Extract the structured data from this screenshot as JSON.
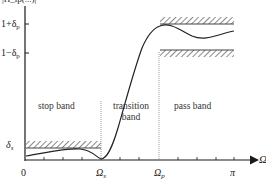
{
  "diagram": {
    "type": "lowpass_filter_tolerance_spec",
    "y_axis_label_cropped": "|H_lp(...)|",
    "y_ticks": {
      "upper_pass": {
        "base": "1+δ",
        "sub": "p"
      },
      "lower_pass": {
        "base": "1−δ",
        "sub": "p"
      },
      "stop": {
        "base": "δ",
        "sub": "s"
      }
    },
    "x_ticks": {
      "origin": "0",
      "stop_edge": {
        "base": "Ω",
        "sub": "s"
      },
      "pass_edge": {
        "base": "Ω",
        "sub": "p"
      },
      "end": "π"
    },
    "x_axis_label": "Ω",
    "regions": {
      "stop": "stop band",
      "transition_line1": "transition",
      "transition_line2": "band",
      "pass": "pass band"
    },
    "colors": {
      "axis": "#1a1a1a",
      "curve": "#222222",
      "hatch": "#8a8a8a",
      "divider": "#999999"
    }
  }
}
